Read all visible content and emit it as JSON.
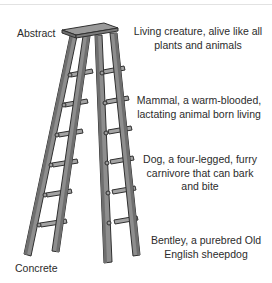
{
  "diagram": {
    "axis": {
      "top_label": "Abstract",
      "bottom_label": "Concrete"
    },
    "levels": [
      {
        "line1": "Living creature, alive like all",
        "line2": "plants and animals",
        "line3": ""
      },
      {
        "line1": "Mammal, a warm-blooded,",
        "line2": "lactating animal born living",
        "line3": ""
      },
      {
        "line1": "Dog, a four-legged, furry",
        "line2": "carnivore that can bark",
        "line3": "and bite"
      },
      {
        "line1": "Bentley, a purebred Old",
        "line2": "English sheepdog",
        "line3": ""
      }
    ],
    "colors": {
      "ladder_fill": "#8e8e8e",
      "ladder_light": "#a9a9a9",
      "ladder_outline": "#2f2f2f",
      "text": "#2b2b2b"
    }
  }
}
